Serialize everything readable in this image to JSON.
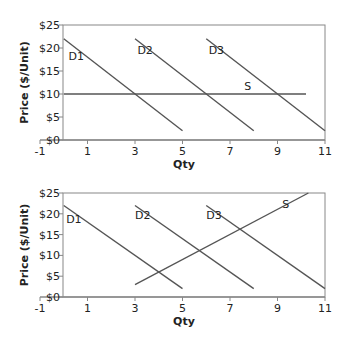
{
  "chart_data": [
    {
      "type": "line",
      "title": "",
      "xlabel": "Qty",
      "ylabel": "Price ($/Unit)",
      "xlim": [
        -1,
        11
      ],
      "ylim": [
        0,
        25
      ],
      "xticks": [
        "-1",
        "1",
        "3",
        "5",
        "7",
        "9",
        "11"
      ],
      "yticks": [
        "$0",
        "$5",
        "$10",
        "$15",
        "$20",
        "$25"
      ],
      "grid": false,
      "legend": "inline labels",
      "series": [
        {
          "name": "D1",
          "x": [
            0,
            5
          ],
          "y": [
            22,
            2
          ]
        },
        {
          "name": "D2",
          "x": [
            3,
            8
          ],
          "y": [
            22,
            2
          ]
        },
        {
          "name": "D3",
          "x": [
            6,
            11
          ],
          "y": [
            22,
            2
          ]
        },
        {
          "name": "S",
          "x": [
            0,
            10.2
          ],
          "y": [
            10,
            10
          ]
        }
      ]
    },
    {
      "type": "line",
      "title": "",
      "xlabel": "Qty",
      "ylabel": "Price ($/Unit)",
      "xlim": [
        -1,
        11
      ],
      "ylim": [
        0,
        25
      ],
      "xticks": [
        "-1",
        "1",
        "3",
        "5",
        "7",
        "9",
        "11"
      ],
      "yticks": [
        "$0",
        "$5",
        "$10",
        "$15",
        "$20",
        "$25"
      ],
      "grid": false,
      "legend": "inline labels",
      "series": [
        {
          "name": "D1",
          "x": [
            0,
            5
          ],
          "y": [
            22,
            2
          ]
        },
        {
          "name": "D2",
          "x": [
            3,
            8
          ],
          "y": [
            22,
            2
          ]
        },
        {
          "name": "D3",
          "x": [
            6,
            11
          ],
          "y": [
            22,
            2
          ]
        },
        {
          "name": "S",
          "x": [
            3,
            10.3
          ],
          "y": [
            3,
            25
          ]
        }
      ]
    }
  ],
  "charts": [
    {
      "xlabel": "Qty",
      "ylabel": "Price ($/Unit)",
      "labels": {
        "d1": "D1",
        "d2": "D2",
        "d3": "D3",
        "s": "S"
      }
    },
    {
      "xlabel": "Qty",
      "ylabel": "Price ($/Unit)",
      "labels": {
        "d1": "D1",
        "d2": "D2",
        "d3": "D3",
        "s": "S"
      }
    }
  ],
  "colors": {
    "line": "#555555",
    "axis": "#888888",
    "text": "#222222"
  }
}
